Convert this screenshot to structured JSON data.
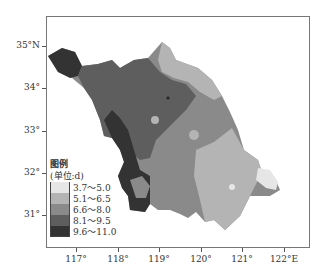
{
  "legend": {
    "title": "图例",
    "unit": "(单位:d)",
    "classes": [
      {
        "label": "3.7～5.0",
        "color": "#e6e6e6"
      },
      {
        "label": "5.1～6.5",
        "color": "#b4b4b4"
      },
      {
        "label": "6.6～8.0",
        "color": "#8a8a8a"
      },
      {
        "label": "8.1～9.5",
        "color": "#5e5e5e"
      },
      {
        "label": "9.6～11.0",
        "color": "#333333"
      }
    ]
  },
  "axes": {
    "y_labels": [
      "35°N",
      "34°",
      "33°",
      "32°",
      "31°"
    ],
    "x_labels": [
      "117°",
      "118°",
      "119°",
      "120°",
      "121°",
      "122°E"
    ]
  }
}
